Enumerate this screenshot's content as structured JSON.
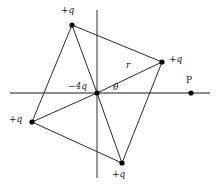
{
  "figure": {
    "kind": "electrostatics-charge-diagram",
    "axes": {
      "x_axis": {
        "name": "x-axis",
        "color": "#8c8c8c",
        "from": [
          10,
          93
        ],
        "to": [
          210,
          93
        ]
      },
      "y_axis": {
        "name": "y-axis",
        "color": "#8c8c8c",
        "from": [
          97,
          10
        ],
        "to": [
          97,
          178
        ]
      },
      "origin": [
        97,
        93
      ]
    },
    "line_color": "#2b2b2b",
    "point_color": "#000000",
    "charges": [
      {
        "id": "center",
        "label": "−4q",
        "x": 97,
        "y": 93,
        "label_x": 69,
        "label_y": 83,
        "anchor": "right"
      },
      {
        "id": "top",
        "label": "+q",
        "x": 72,
        "y": 25,
        "label_x": 62,
        "label_y": 8,
        "anchor": "center"
      },
      {
        "id": "right",
        "label": "+q",
        "x": 162,
        "y": 62,
        "label_x": 169,
        "label_y": 57,
        "anchor": "left"
      },
      {
        "id": "left",
        "label": "+q",
        "x": 32,
        "y": 122,
        "label_x": 10,
        "label_y": 117,
        "anchor": "right"
      },
      {
        "id": "bottom",
        "label": "+q",
        "x": 122,
        "y": 163,
        "label_x": 113,
        "label_y": 172,
        "anchor": "center"
      }
    ],
    "field_point": {
      "id": "P",
      "label": "P",
      "x": 191,
      "y": 93,
      "label_x": 186,
      "label_y": 78
    },
    "segments": [
      {
        "name": "segment-top-to-left",
        "from": [
          72,
          25
        ],
        "to": [
          32,
          122
        ]
      },
      {
        "name": "segment-top-to-origin",
        "from": [
          72,
          25
        ],
        "to": [
          97,
          93
        ]
      },
      {
        "name": "segment-top-to-right",
        "from": [
          72,
          25
        ],
        "to": [
          162,
          62
        ]
      },
      {
        "name": "segment-right-to-bottom",
        "from": [
          162,
          62
        ],
        "to": [
          122,
          163
        ]
      },
      {
        "name": "segment-bottom-to-origin",
        "from": [
          122,
          163
        ],
        "to": [
          97,
          93
        ]
      },
      {
        "name": "segment-bottom-to-left",
        "from": [
          122,
          163
        ],
        "to": [
          32,
          122
        ]
      },
      {
        "name": "segment-left-to-origin",
        "from": [
          32,
          122
        ],
        "to": [
          97,
          93
        ]
      }
    ],
    "radius_vector": {
      "name": "radius-r",
      "from": [
        97,
        93
      ],
      "to": [
        162,
        62
      ],
      "label": "r",
      "label_x": 126,
      "label_y": 63
    },
    "angle": {
      "name": "angle-theta",
      "label": "θ",
      "label_x": 113,
      "label_y": 84
    }
  }
}
